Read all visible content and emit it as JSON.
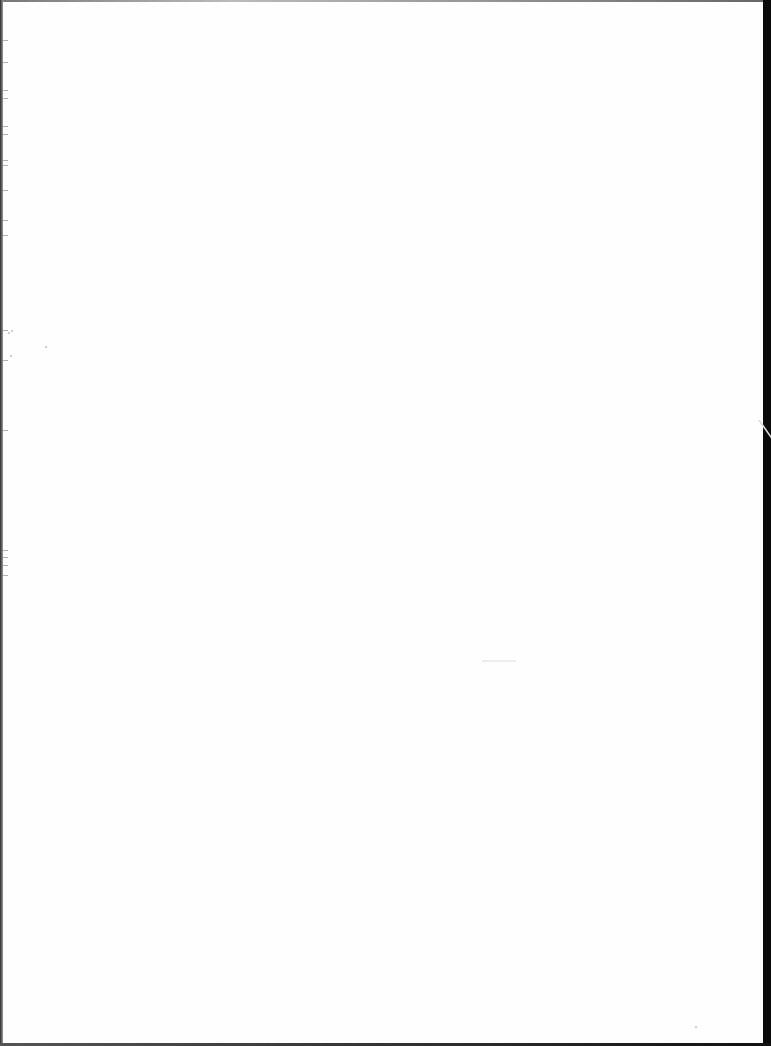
{
  "document": {
    "type": "scanned-page",
    "content": "",
    "is_blank": true
  },
  "colors": {
    "page_background": "#ffffff",
    "scan_edge_right": "#0a0a0a",
    "scan_edge_left": "#2a2a2a",
    "scan_edge_bottom": "#222222"
  }
}
